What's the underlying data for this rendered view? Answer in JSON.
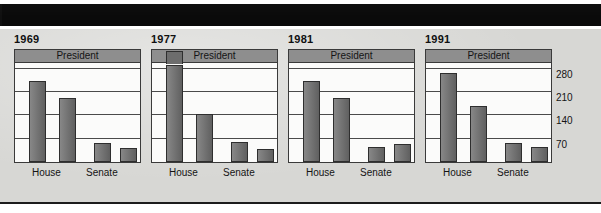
{
  "figure": {
    "president_band_label": "President",
    "group_labels": [
      "House",
      "Senate"
    ],
    "y_ticks": [
      280,
      210,
      140,
      70
    ],
    "colors": {
      "banner": "#0a0a0a",
      "paper": "#d7d7d4",
      "plot_background": "#fbfbfa",
      "bar": "#6d6d6d",
      "band": "#8e8e8e",
      "ink": "#141414"
    }
  },
  "chart_data": {
    "type": "bar",
    "title": "",
    "xlabel": "",
    "ylabel": "",
    "ylim": [
      0,
      300
    ],
    "yticks": [
      70,
      140,
      210,
      280
    ],
    "grid": true,
    "legend": "none",
    "panels": [
      {
        "year": "1969",
        "president_label": "President",
        "categories": [
          "House",
          "Senate"
        ],
        "bars": [
          {
            "group": "House",
            "party": "Democrat",
            "value": 243
          },
          {
            "group": "House",
            "party": "Republican",
            "value": 192
          },
          {
            "group": "Senate",
            "party": "Democrat",
            "value": 58
          },
          {
            "group": "Senate",
            "party": "Republican",
            "value": 42
          }
        ]
      },
      {
        "year": "1977",
        "president_label": "President",
        "categories": [
          "House",
          "Senate"
        ],
        "bars": [
          {
            "group": "House",
            "party": "Democrat",
            "value": 292
          },
          {
            "group": "House",
            "party": "Republican",
            "value": 143
          },
          {
            "group": "Senate",
            "party": "Democrat",
            "value": 61
          },
          {
            "group": "Senate",
            "party": "Republican",
            "value": 38
          }
        ]
      },
      {
        "year": "1981",
        "president_label": "President",
        "categories": [
          "House",
          "Senate"
        ],
        "bars": [
          {
            "group": "House",
            "party": "Democrat",
            "value": 243
          },
          {
            "group": "House",
            "party": "Republican",
            "value": 192
          },
          {
            "group": "Senate",
            "party": "Democrat",
            "value": 46
          },
          {
            "group": "Senate",
            "party": "Republican",
            "value": 53
          }
        ]
      },
      {
        "year": "1991",
        "president_label": "President",
        "categories": [
          "House",
          "Senate"
        ],
        "bars": [
          {
            "group": "House",
            "party": "Democrat",
            "value": 267
          },
          {
            "group": "House",
            "party": "Republican",
            "value": 167
          },
          {
            "group": "Senate",
            "party": "Democrat",
            "value": 56
          },
          {
            "group": "Senate",
            "party": "Republican",
            "value": 44
          }
        ]
      }
    ]
  }
}
